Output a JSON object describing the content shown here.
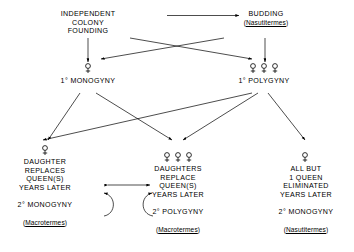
{
  "diagram": {
    "background": "#ffffff",
    "line_color": "#000000",
    "nodes": {
      "independent_founding": {
        "lines": [
          "INDEPENDENT",
          "COLONY",
          "FOUNDING"
        ]
      },
      "budding": {
        "lines": [
          "BUDDING"
        ],
        "genus_open": "(",
        "genus": "Nasutitermes",
        "genus_close": ")"
      },
      "primary_monogyny": {
        "label": "1°  MONOGYNY",
        "symbol": "female-symbol",
        "symbol_count": 1
      },
      "primary_polygyny": {
        "label": "1°  POLYGYNY",
        "symbol": "female-symbol",
        "symbol_count": 3
      },
      "secondary_monogyny_left": {
        "symbol": "female-symbol",
        "symbol_count": 1,
        "lines": [
          "DAUGHTER",
          "REPLACES",
          "QUEEN(S)",
          "YEARS  LATER"
        ],
        "outcome": "2°   MONOGYNY",
        "genus_open": "(",
        "genus": "Macrotermes",
        "genus_close": ")"
      },
      "secondary_polygyny_middle": {
        "symbol": "female-symbol",
        "symbol_count": 3,
        "lines": [
          "DAUGHTERS",
          "REPLACE",
          "QUEEN(S)",
          "YEARS  LATER"
        ],
        "outcome": "2°   POLYGYNY",
        "genus_open": "(",
        "genus": "Macrotermes",
        "genus_close": ")"
      },
      "secondary_monogyny_right": {
        "symbol": "female-symbol",
        "symbol_count": 1,
        "lines": [
          "ALL  BUT",
          "1 QUEEN",
          "ELIMINATED",
          "YEARS  LATER"
        ],
        "outcome": "2°   MONOGYNY",
        "genus_open": "(",
        "genus": "Nasutitermes",
        "genus_close": ")"
      }
    },
    "edges": [
      {
        "name": "independent-to-budding",
        "from": "independent_founding",
        "to": "budding",
        "style": "straight-arrow"
      },
      {
        "name": "independent-to-monogyny",
        "from": "independent_founding",
        "to": "primary_monogyny",
        "style": "vertical-arrow"
      },
      {
        "name": "budding-to-polygyny",
        "from": "budding",
        "to": "primary_polygyny",
        "style": "vertical-arrow"
      },
      {
        "name": "independent-to-polygyny",
        "from": "independent_founding",
        "to": "primary_polygyny",
        "style": "diagonal-arrow"
      },
      {
        "name": "budding-to-monogyny",
        "from": "budding",
        "to": "primary_monogyny",
        "style": "diagonal-arrow"
      },
      {
        "name": "monogyny-to-left-box",
        "from": "primary_monogyny",
        "to": "secondary_monogyny_left",
        "style": "diagonal-arrow"
      },
      {
        "name": "monogyny-to-middle-box",
        "from": "primary_monogyny",
        "to": "secondary_polygyny_middle",
        "style": "diagonal-arrow"
      },
      {
        "name": "polygyny-to-left-box",
        "from": "primary_polygyny",
        "to": "secondary_monogyny_left",
        "style": "diagonal-arrow"
      },
      {
        "name": "polygyny-to-middle-box",
        "from": "primary_polygyny",
        "to": "secondary_polygyny_middle",
        "style": "diagonal-arrow"
      },
      {
        "name": "polygyny-to-right-box",
        "from": "primary_polygyny",
        "to": "secondary_monogyny_right",
        "style": "diagonal-arrow"
      },
      {
        "name": "left-box-loop",
        "from": "secondary_monogyny_left",
        "to": "secondary_monogyny_left",
        "style": "curved-feedback-arrow"
      },
      {
        "name": "middle-box-loop",
        "from": "secondary_polygyny_middle",
        "to": "secondary_polygyny_middle",
        "style": "curved-feedback-arrow"
      },
      {
        "name": "left-box-to-middle-box",
        "from": "secondary_monogyny_left",
        "to": "secondary_polygyny_middle",
        "style": "double-headed-horizontal-arrow"
      }
    ]
  }
}
